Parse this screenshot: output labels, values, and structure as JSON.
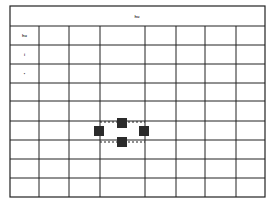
{
  "diagram": {
    "header_label": "hu",
    "row_labels": [
      "hu",
      "i",
      "•",
      "",
      "",
      "",
      "",
      "",
      ""
    ],
    "grid": {
      "left": 10,
      "top": 6,
      "right": 265,
      "bottom": 197,
      "header_bottom": 26,
      "column_lines": [
        39,
        69,
        100,
        145,
        176,
        205,
        236
      ],
      "row_lines": [
        45,
        64,
        83,
        101,
        121,
        140,
        159,
        178
      ],
      "line_color": "#222222"
    },
    "markers": [
      {
        "name": "marker-top",
        "x": 117,
        "y": 118,
        "size": 10
      },
      {
        "name": "marker-left",
        "x": 94,
        "y": 126,
        "size": 10
      },
      {
        "name": "marker-right",
        "x": 139,
        "y": 126,
        "size": 10
      },
      {
        "name": "marker-bottom",
        "x": 117,
        "y": 137,
        "size": 10
      }
    ],
    "marker_color": "#2b2b2b",
    "dashed_lines": [
      {
        "x1": 100,
        "y1": 122,
        "x2": 145,
        "y2": 122
      },
      {
        "x1": 100,
        "y1": 142,
        "x2": 145,
        "y2": 142
      }
    ],
    "caption": "Fig. … (caption text partially cut off / illegible)"
  }
}
